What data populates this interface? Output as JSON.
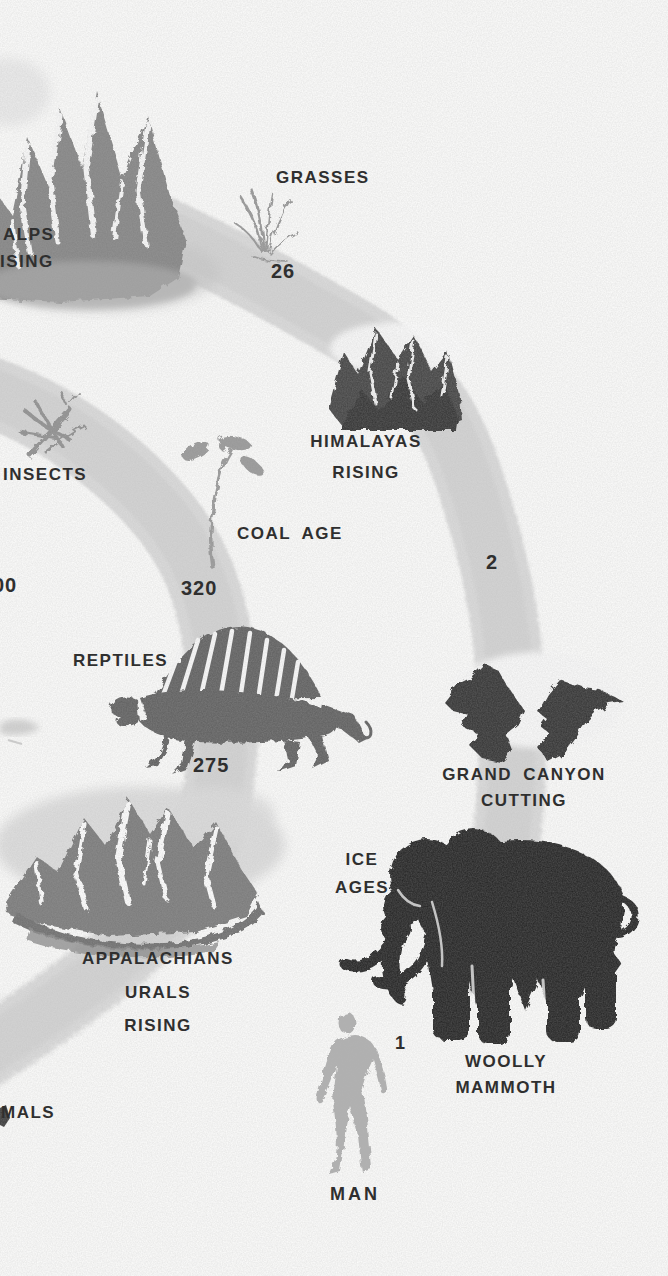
{
  "illustration": {
    "name": "geologic-time-winding-path",
    "colors": {
      "background": "#fdfdfc",
      "path_band": "#dbdbdb",
      "text": "#2f2f2f",
      "mountain_gray": "#7d7d7d",
      "dark_mountain_gray": "#424242",
      "reptile_gray": "#5f5f5f",
      "silhouette_black": "#242424",
      "canyon_black": "#303030",
      "man_gray": "#b0b0b0"
    },
    "labels": {
      "alps_line1": "ALPS",
      "alps_line2": "ISING",
      "grasses": "GRASSES",
      "himalayas_line1": "HIMALAYAS",
      "himalayas_line2": "RISING",
      "insects": "INSECTS",
      "coal_age": "COAL AGE",
      "reptiles": "REPTILES",
      "grand_canyon_line1": "GRAND CANYON",
      "grand_canyon_line2": "CUTTING",
      "ice_ages_line1": "ICE",
      "ice_ages_line2": "AGES",
      "appalachians_line1": "APPALACHIANS",
      "appalachians_line2": "URALS",
      "appalachians_line3": "RISING",
      "woolly_mammoth_line1": "WOOLLY",
      "woolly_mammoth_line2": "MAMMOTH",
      "mammals_partial": "MALS",
      "man": "MAN"
    },
    "time_markers_millions_of_years": {
      "grasses": "26",
      "pleistocene": "2",
      "coal_age": "320",
      "left_edge_partial": "00",
      "reptiles": "275",
      "man_ice_age": "1"
    },
    "icons": [
      "alps-mountains-icon",
      "grass-icon",
      "himalayas-mountains-icon",
      "dragonfly-insect-icon",
      "coal-age-plant-icon",
      "dimetrodon-reptile-icon",
      "grand-canyon-icon",
      "appalachians-mountains-icon",
      "woolly-mammoth-icon",
      "man-figure-icon",
      "timeline-path-band"
    ]
  }
}
